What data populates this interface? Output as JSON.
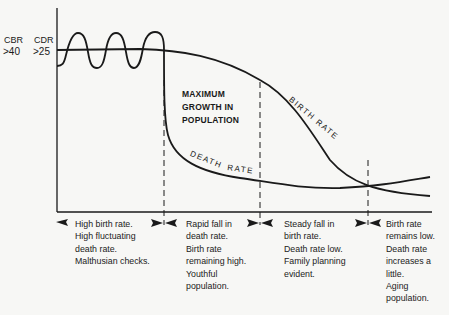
{
  "axis": {
    "cbr_label": "CBR",
    "cdr_label": "CDR",
    "cbr_value": ">40",
    "cdr_value": ">25"
  },
  "annotations": {
    "growth_line1": "MAXIMUM",
    "growth_line2": "GROWTH IN",
    "growth_line3": "POPULATION",
    "birth_rate": "BIRTH RATE",
    "death_rate_1": "DEATH",
    "death_rate_2": "RATE"
  },
  "stages": [
    {
      "lines": [
        "High birth rate.",
        "High fluctuating",
        "death rate.",
        "Malthusian checks."
      ]
    },
    {
      "lines": [
        "Rapid fall in",
        "death rate.",
        "Birth rate",
        "remaining high.",
        "Youthful",
        "population."
      ]
    },
    {
      "lines": [
        "Steady fall in",
        "birth rate.",
        "Death rate low.",
        "Family planning",
        "evident."
      ]
    },
    {
      "lines": [
        "Birth rate",
        "remains low.",
        "Death rate",
        "increases a",
        "little.",
        "Aging",
        "population."
      ]
    }
  ],
  "colors": {
    "line": "#1a1a1a",
    "background": "#f7f7f5"
  }
}
